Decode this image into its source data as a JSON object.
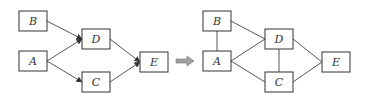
{
  "diagram": {
    "left": {
      "nodes": [
        {
          "id": "B",
          "label": "B",
          "x": 19,
          "y": 11,
          "w": 28,
          "h": 20
        },
        {
          "id": "A",
          "label": "A",
          "x": 19,
          "y": 51,
          "w": 28,
          "h": 20
        },
        {
          "id": "D",
          "label": "D",
          "x": 82,
          "y": 29,
          "w": 28,
          "h": 20
        },
        {
          "id": "C",
          "label": "C",
          "x": 82,
          "y": 72,
          "w": 28,
          "h": 20
        },
        {
          "id": "E",
          "label": "E",
          "x": 140,
          "y": 52,
          "w": 28,
          "h": 20
        }
      ],
      "edges": [
        {
          "from": "B",
          "to": "D",
          "directed": true
        },
        {
          "from": "A",
          "to": "D",
          "directed": true
        },
        {
          "from": "A",
          "to": "C",
          "directed": true
        },
        {
          "from": "D",
          "to": "E",
          "directed": true
        },
        {
          "from": "C",
          "to": "E",
          "directed": true
        }
      ]
    },
    "transform_arrow": {
      "color": "#a0a0a0"
    },
    "right": {
      "nodes": [
        {
          "id": "B",
          "label": "B",
          "x": 203,
          "y": 11,
          "w": 28,
          "h": 20
        },
        {
          "id": "A",
          "label": "A",
          "x": 203,
          "y": 51,
          "w": 28,
          "h": 20
        },
        {
          "id": "D",
          "label": "D",
          "x": 265,
          "y": 29,
          "w": 28,
          "h": 20
        },
        {
          "id": "C",
          "label": "C",
          "x": 265,
          "y": 72,
          "w": 28,
          "h": 20
        },
        {
          "id": "E",
          "label": "E",
          "x": 322,
          "y": 52,
          "w": 28,
          "h": 20
        }
      ],
      "edges": [
        {
          "from": "B",
          "to": "A",
          "directed": false
        },
        {
          "from": "B",
          "to": "D",
          "directed": false
        },
        {
          "from": "A",
          "to": "D",
          "directed": false
        },
        {
          "from": "A",
          "to": "C",
          "directed": false
        },
        {
          "from": "D",
          "to": "C",
          "directed": false
        },
        {
          "from": "D",
          "to": "E",
          "directed": false
        },
        {
          "from": "C",
          "to": "E",
          "directed": false
        }
      ]
    }
  }
}
